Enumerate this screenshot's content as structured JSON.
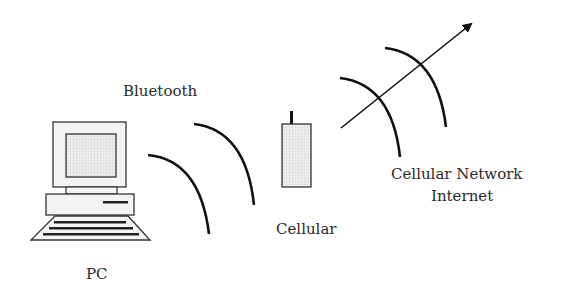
{
  "diagram": {
    "labels": {
      "pc": "PC",
      "bluetooth": "Bluetooth",
      "cellular": "Cellular",
      "network_line1": "Cellular Network",
      "network_line2": "Internet"
    },
    "nodes": [
      {
        "id": "pc",
        "type": "desktop-computer",
        "label": "PC"
      },
      {
        "id": "cellular",
        "type": "mobile-phone",
        "label": "Cellular"
      },
      {
        "id": "network",
        "type": "network-cloud",
        "label": "Cellular Network / Internet"
      }
    ],
    "links": [
      {
        "from": "pc",
        "to": "cellular",
        "medium": "Bluetooth",
        "style": "radio-waves"
      },
      {
        "from": "cellular",
        "to": "network",
        "medium": "Cellular",
        "style": "radio-waves-with-arrow"
      }
    ],
    "colors": {
      "stroke": "#1a1a1a",
      "fill_light": "#f2f2f2",
      "fill_screen": "#e3e3e3",
      "text": "#2a2a2a"
    }
  }
}
